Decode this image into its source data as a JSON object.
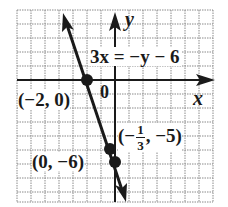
{
  "diagram": {
    "type": "coordinate-graph",
    "equation": "3x = −y − 6",
    "axes": {
      "x_label": "x",
      "y_label": "y",
      "origin_label": "0"
    },
    "grid": {
      "x_min": -7,
      "x_max": 7,
      "y_min": -8,
      "y_max": 5,
      "step": 1
    },
    "points": [
      {
        "label": "(−2, 0)",
        "x": -2,
        "y": 0
      },
      {
        "label_prefix": "(−",
        "label_num": "1",
        "label_den": "3",
        "label_suffix": ", −5)",
        "x": -0.3333,
        "y": -5
      },
      {
        "label": "(0, −6)",
        "x": 0,
        "y": -6
      }
    ],
    "colors": {
      "line": "#1a1a1a",
      "grid": "#8a8a8a",
      "background": "#ffffff"
    }
  }
}
